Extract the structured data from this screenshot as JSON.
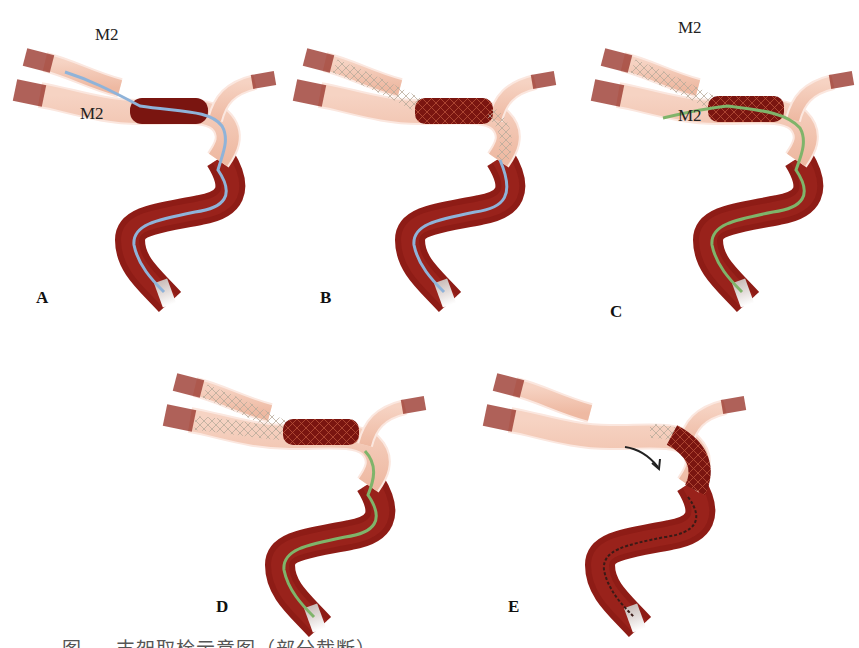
{
  "figure": {
    "panels": [
      {
        "id": "A",
        "label": "A",
        "guidewire": "blue",
        "clot_state": "intact",
        "stent": false,
        "vessel_labels": [
          "M2",
          "M2"
        ]
      },
      {
        "id": "B",
        "label": "B",
        "guidewire": "blue",
        "clot_state": "stent-deployed",
        "stent": true,
        "vessel_labels": []
      },
      {
        "id": "C",
        "label": "C",
        "guidewire": "green",
        "clot_state": "stent-deployed",
        "stent": true,
        "vessel_labels": [
          "M2",
          "M2"
        ]
      },
      {
        "id": "D",
        "label": "D",
        "guidewire": "green",
        "clot_state": "stent-deployed",
        "stent": true,
        "vessel_labels": []
      },
      {
        "id": "E",
        "label": "E",
        "guidewire": "dark",
        "clot_state": "retrieving",
        "stent": true,
        "vessel_labels": [],
        "arrow": "retrieval-direction"
      }
    ],
    "caption": "图 — 支架取栓示意图（部分截断）"
  },
  "colors": {
    "vessel_outer": "#8e1c16",
    "vessel_lumen": "#f2c1ab",
    "vessel_edge": "#fbe7df",
    "clot": "#7a1510",
    "guidewire_blue": "#8fb3d9",
    "guidewire_green": "#7fb46a",
    "catheter": "#b8b0ad",
    "text": "#111111"
  }
}
